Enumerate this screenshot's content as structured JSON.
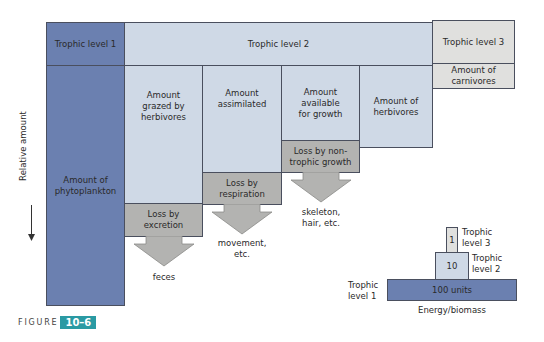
{
  "header": {
    "tl1": "Trophic level 1",
    "tl2": "Trophic level 2",
    "tl3": "Trophic level 3"
  },
  "columns": {
    "phytoplankton": "Amount of phytoplankton",
    "grazed": "Amount grazed by herbivores",
    "assimilated": "Amount assimilated",
    "available": "Amount available for growth",
    "herbivores": "Amount of herbivores",
    "carnivores": "Amount of carnivores"
  },
  "losses": {
    "excretion": "Loss by excretion",
    "respiration": "Loss by respiration",
    "nontrophic": "Loss by non-trophic growth"
  },
  "outputs": {
    "feces": "feces",
    "movement": "movement, etc.",
    "skeleton": "skeleton, hair, etc."
  },
  "axis": {
    "ylabel": "Relative amount"
  },
  "pyramid": {
    "base_value": "100 units",
    "mid_value": "10",
    "top_value": "1",
    "label_tl1": "Trophic level 1",
    "label_tl2": "Trophic level 2",
    "label_tl3": "Trophic level 3",
    "xlabel": "Energy/biomass"
  },
  "figure": {
    "word": "FIGURE",
    "number": "10–6"
  },
  "colors": {
    "trophic1": "#6b80b0",
    "trophic2": "#cfd9e6",
    "trophic3": "#e0e0de",
    "loss": "#b3b3b1",
    "figure_badge": "#2a9aa3"
  }
}
